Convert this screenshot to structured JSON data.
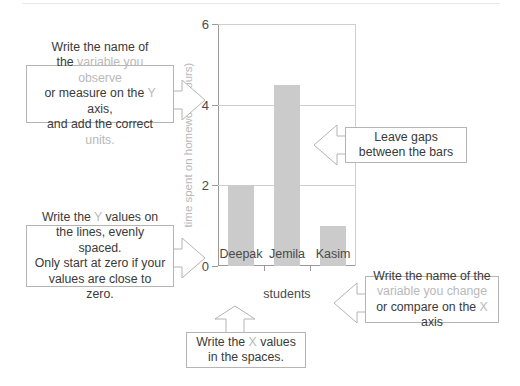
{
  "chart_data": {
    "type": "bar",
    "title": "",
    "categories": [
      "Deepak",
      "Jemila",
      "Kasim"
    ],
    "values": [
      2,
      4.5,
      1
    ],
    "xlabel": "students",
    "ylabel": "time spent on homework (hours)",
    "ylim": [
      0,
      6
    ],
    "yticks": [
      0,
      2,
      4,
      6
    ],
    "ytick_labels": [
      "0",
      "2",
      "4",
      "6"
    ],
    "grid": true,
    "legend": false,
    "bar_color": "#cbcbcb",
    "axis_color": "#9a9a9a",
    "gridline_color": "#cfcfcf"
  },
  "callouts": {
    "y_axis_name": {
      "id": "y-axis-name-callout",
      "direction": "right",
      "lines": [
        [
          {
            "t": "Write the name of",
            "muted": false
          }
        ],
        [
          {
            "t": "the ",
            "muted": false
          },
          {
            "t": "variable you observe",
            "muted": true
          }
        ],
        [
          {
            "t": "or measure on the ",
            "muted": false
          },
          {
            "t": "Y",
            "muted": true
          },
          {
            "t": " axis,",
            "muted": false
          }
        ],
        [
          {
            "t": "and add the correct ",
            "muted": false
          },
          {
            "t": "units.",
            "muted": true
          }
        ]
      ]
    },
    "y_values": {
      "id": "y-values-callout",
      "direction": "right",
      "lines": [
        [
          {
            "t": "Write the ",
            "muted": false
          },
          {
            "t": "Y",
            "muted": true
          },
          {
            "t": " values on",
            "muted": false
          }
        ],
        [
          {
            "t": "the lines, evenly spaced.",
            "muted": false
          }
        ],
        [
          {
            "t": "Only start at zero if your",
            "muted": false
          }
        ],
        [
          {
            "t": "values are close to zero.",
            "muted": false
          }
        ]
      ]
    },
    "gaps": {
      "id": "gaps-callout",
      "direction": "left",
      "lines": [
        [
          {
            "t": "Leave gaps",
            "muted": false
          }
        ],
        [
          {
            "t": "between the bars",
            "muted": false
          }
        ]
      ]
    },
    "x_axis_name": {
      "id": "x-axis-name-callout",
      "direction": "left",
      "lines": [
        [
          {
            "t": "Write the name of the",
            "muted": false
          }
        ],
        [
          {
            "t": "variable you change",
            "muted": true
          }
        ],
        [
          {
            "t": "or compare on the ",
            "muted": false
          },
          {
            "t": "X",
            "muted": true
          },
          {
            "t": " axis",
            "muted": false
          }
        ]
      ]
    },
    "x_values": {
      "id": "x-values-callout",
      "direction": "up",
      "lines": [
        [
          {
            "t": "Write the ",
            "muted": false
          },
          {
            "t": "X",
            "muted": true
          },
          {
            "t": " values",
            "muted": false
          }
        ],
        [
          {
            "t": "in the spaces.",
            "muted": false
          }
        ]
      ]
    }
  }
}
